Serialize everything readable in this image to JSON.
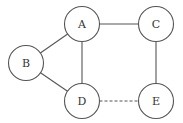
{
  "diagram": {
    "type": "undirected-graph",
    "node_radius": 17.5,
    "colors": {
      "stroke": "#555555",
      "label": "#333333",
      "fill": "#ffffff",
      "background": "#ffffff"
    },
    "nodes": [
      {
        "id": "A",
        "label": "A",
        "cx": 82,
        "cy": 24
      },
      {
        "id": "B",
        "label": "B",
        "cx": 26,
        "cy": 63
      },
      {
        "id": "C",
        "label": "C",
        "cx": 156,
        "cy": 24
      },
      {
        "id": "D",
        "label": "D",
        "cx": 82,
        "cy": 101
      },
      {
        "id": "E",
        "label": "E",
        "cx": 156,
        "cy": 101
      }
    ],
    "edges": [
      {
        "from": "A",
        "to": "C",
        "style": "solid"
      },
      {
        "from": "A",
        "to": "B",
        "style": "solid"
      },
      {
        "from": "A",
        "to": "D",
        "style": "solid"
      },
      {
        "from": "B",
        "to": "D",
        "style": "solid"
      },
      {
        "from": "C",
        "to": "E",
        "style": "solid"
      },
      {
        "from": "D",
        "to": "E",
        "style": "dashed"
      }
    ]
  }
}
